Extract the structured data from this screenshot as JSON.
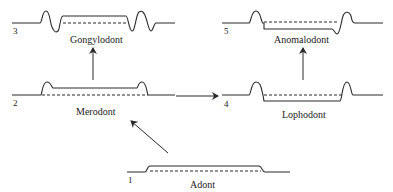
{
  "diagram": {
    "type": "tooth-crown-evolution",
    "stages": [
      {
        "number": "1",
        "label": "Adont"
      },
      {
        "number": "2",
        "label": "Merodont"
      },
      {
        "number": "3",
        "label": "Gongylodont"
      },
      {
        "number": "4",
        "label": "Lophodont"
      },
      {
        "number": "5",
        "label": "Anomalodont"
      }
    ],
    "arrows": [
      {
        "from": "Adont",
        "to": "Merodont"
      },
      {
        "from": "Merodont",
        "to": "Gongylodont"
      },
      {
        "from": "Merodont",
        "to": "Lophodont"
      },
      {
        "from": "Lophodont",
        "to": "Anomalodont"
      }
    ],
    "colors": {
      "line": "#2a2a2a",
      "background": "#ffffff"
    }
  }
}
